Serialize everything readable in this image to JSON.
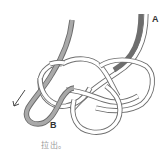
{
  "diagram": {
    "type": "knot-tying-step",
    "labels": {
      "end_a": "A",
      "end_b": "B"
    },
    "caption": "拉出。",
    "arrow": {
      "direction": "down-left",
      "meaning": "pull end B out"
    },
    "colors": {
      "rope_outline": "#6e6e6e",
      "rope_fill": "#ffffff",
      "cord_b_fill": "#a9a9a9",
      "caption_text": "#9a9a9a",
      "label_text": "#333333"
    }
  }
}
